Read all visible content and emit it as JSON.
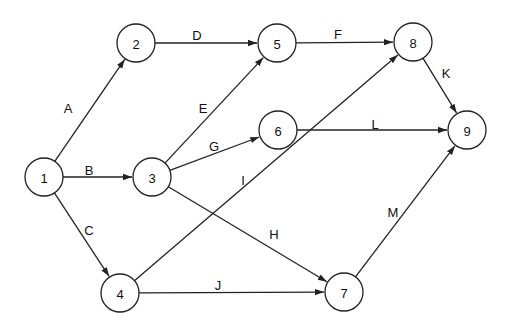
{
  "diagram": {
    "type": "activity-on-arrow network",
    "nodes": [
      {
        "id": "1",
        "x": 44,
        "y": 177
      },
      {
        "id": "2",
        "x": 136,
        "y": 43
      },
      {
        "id": "3",
        "x": 152,
        "y": 177
      },
      {
        "id": "4",
        "x": 120,
        "y": 293
      },
      {
        "id": "5",
        "x": 277,
        "y": 43
      },
      {
        "id": "6",
        "x": 278,
        "y": 130
      },
      {
        "id": "7",
        "x": 344,
        "y": 292
      },
      {
        "id": "8",
        "x": 413,
        "y": 42
      },
      {
        "id": "9",
        "x": 467,
        "y": 130
      }
    ],
    "edges": [
      {
        "label": "A",
        "from": "1",
        "to": "2",
        "lx": 68,
        "ly": 108
      },
      {
        "label": "B",
        "from": "1",
        "to": "3",
        "lx": 89,
        "ly": 170
      },
      {
        "label": "C",
        "from": "1",
        "to": "4",
        "lx": 89,
        "ly": 230
      },
      {
        "label": "D",
        "from": "2",
        "to": "5",
        "lx": 197,
        "ly": 35
      },
      {
        "label": "E",
        "from": "3",
        "to": "5",
        "lx": 203,
        "ly": 108
      },
      {
        "label": "G",
        "from": "3",
        "to": "6",
        "lx": 214,
        "ly": 146
      },
      {
        "label": "H",
        "from": "3",
        "to": "7",
        "lx": 274,
        "ly": 234
      },
      {
        "label": "I",
        "from": "4",
        "to": "8",
        "lx": 243,
        "ly": 180
      },
      {
        "label": "J",
        "from": "4",
        "to": "7",
        "lx": 218,
        "ly": 285
      },
      {
        "label": "F",
        "from": "5",
        "to": "8",
        "lx": 338,
        "ly": 34
      },
      {
        "label": "L",
        "from": "6",
        "to": "9",
        "lx": 375,
        "ly": 124
      },
      {
        "label": "K",
        "from": "8",
        "to": "9",
        "lx": 446,
        "ly": 73
      },
      {
        "label": "M",
        "from": "7",
        "to": "9",
        "lx": 393,
        "ly": 212
      }
    ],
    "node_radius": 19
  }
}
